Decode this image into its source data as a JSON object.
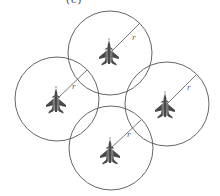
{
  "figure": {
    "panel_label": "(c)",
    "radius_label": "r"
  },
  "colors": {
    "circle_stroke": "#555555",
    "aircraft": "#4a4a4a",
    "background": "#ffffff"
  },
  "nodes": [
    {
      "id": "top",
      "icon": "fighter-jet-icon",
      "cx": 110,
      "cy": 53,
      "r": 42,
      "line_end": [
        140,
        23
      ],
      "label_pos": [
        132,
        40
      ]
    },
    {
      "id": "left",
      "icon": "fighter-jet-icon",
      "cx": 57,
      "cy": 99,
      "r": 42,
      "line_end": [
        87,
        70
      ],
      "label_pos": [
        72,
        89
      ]
    },
    {
      "id": "right",
      "icon": "fighter-jet-icon",
      "cx": 167,
      "cy": 104,
      "r": 42,
      "line_end": [
        196,
        75
      ],
      "label_pos": [
        187,
        90
      ]
    },
    {
      "id": "bottom",
      "icon": "fighter-jet-icon",
      "cx": 111,
      "cy": 148,
      "r": 42,
      "line_end": [
        141,
        120
      ],
      "label_pos": [
        127,
        137
      ]
    }
  ]
}
